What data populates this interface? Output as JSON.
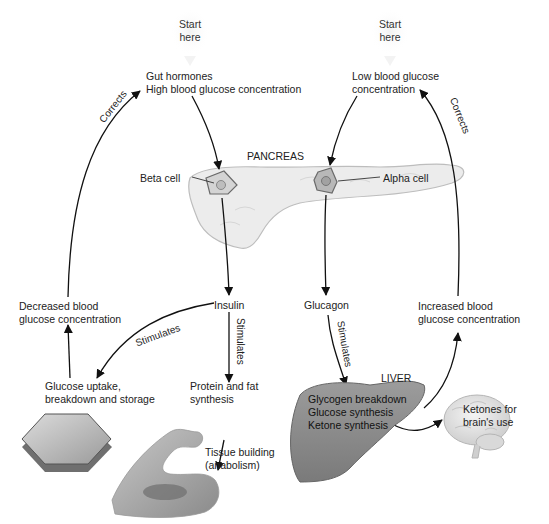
{
  "diagram": {
    "start_left": [
      "Start",
      "here"
    ],
    "start_right": [
      "Start",
      "here"
    ],
    "left_trigger": [
      "Gut hormones",
      "High blood glucose concentration"
    ],
    "right_trigger": [
      "Low blood glucose",
      "concentration"
    ],
    "pancreas_label": "PANCREAS",
    "beta_cell_label": "Beta cell",
    "alpha_cell_label": "Alpha cell",
    "insulin_label": "Insulin",
    "glucagon_label": "Glucagon",
    "decreased_label": [
      "Decreased blood",
      "glucose concentration"
    ],
    "increased_label": [
      "Increased blood",
      "glucose concentration"
    ],
    "glucose_uptake_label": [
      "Glucose uptake,",
      "breakdown and storage"
    ],
    "protein_label": [
      "Protein and fat",
      "synthesis"
    ],
    "tissue_label": [
      "Tissue building",
      "(anabolism)"
    ],
    "liver_label": "LIVER",
    "liver_processes": [
      "Glycogen breakdown",
      "Glucose synthesis",
      "Ketone synthesis"
    ],
    "ketones_label": [
      "Ketones for",
      "brain's use"
    ],
    "edge_labels": {
      "corrects_left": "Corrects",
      "corrects_right": "Corrects",
      "stimulates_insulin_glucose": "Stimulates",
      "stimulates_insulin_protein": "Stimulates",
      "stimulates_glucagon_liver": "Stimulates"
    }
  }
}
